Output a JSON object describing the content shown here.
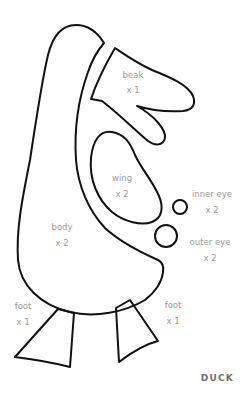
{
  "title": "DUCK",
  "colors": {
    "outline": "#111111",
    "label": "#9a9a9a",
    "title": "#707070",
    "background": "#ffffff"
  },
  "pieces": {
    "beak": {
      "name": "beak",
      "count": "x 1"
    },
    "wing": {
      "name": "wing",
      "count": "x 2"
    },
    "inner_eye": {
      "name": "inner eye",
      "count": "x 2"
    },
    "outer_eye": {
      "name": "outer eye",
      "count": "x 2"
    },
    "body": {
      "name": "body",
      "count": "x 2"
    },
    "foot_left": {
      "name": "foot",
      "count": "x 1"
    },
    "foot_right": {
      "name": "foot",
      "count": "x 1"
    }
  }
}
